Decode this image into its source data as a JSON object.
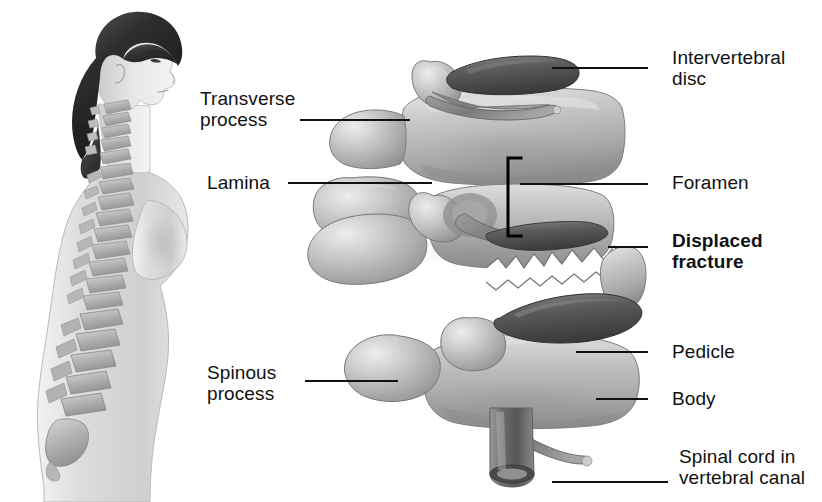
{
  "figure": {
    "background": "#ffffff",
    "ink": "#111111"
  },
  "labels": [
    {
      "id": "intervertebral-disc",
      "text": "Intervertebral\ndisc",
      "bold": false,
      "x": 672,
      "y": 47
    },
    {
      "id": "transverse-process",
      "text": "Transverse\nprocess",
      "bold": false,
      "x": 200,
      "y": 88
    },
    {
      "id": "lamina",
      "text": "Lamina",
      "bold": false,
      "x": 207,
      "y": 172
    },
    {
      "id": "foramen",
      "text": "Foramen",
      "bold": false,
      "x": 672,
      "y": 172
    },
    {
      "id": "displaced-fracture",
      "text": "Displaced\nfracture",
      "bold": true,
      "x": 672,
      "y": 230
    },
    {
      "id": "pedicle",
      "text": "Pedicle",
      "bold": false,
      "x": 672,
      "y": 341
    },
    {
      "id": "body",
      "text": "Body",
      "bold": false,
      "x": 672,
      "y": 388
    },
    {
      "id": "spinous-process",
      "text": "Spinous\nprocess",
      "bold": false,
      "x": 207,
      "y": 362
    },
    {
      "id": "spinal-cord",
      "text": "Spinal cord in\nvertebral canal",
      "bold": false,
      "x": 679,
      "y": 446
    }
  ],
  "leader_lines": [
    {
      "id": "leader-intervertebral-disc",
      "x1": 648,
      "y1": 68,
      "x2": 552,
      "y2": 68
    },
    {
      "id": "leader-transverse-process",
      "x1": 300,
      "y1": 120,
      "x2": 410,
      "y2": 120
    },
    {
      "id": "leader-lamina",
      "x1": 288,
      "y1": 183,
      "x2": 432,
      "y2": 183
    },
    {
      "id": "leader-foramen",
      "x1": 648,
      "y1": 184,
      "x2": 520,
      "y2": 184
    },
    {
      "id": "leader-displaced-fracture",
      "x1": 648,
      "y1": 247,
      "x2": 608,
      "y2": 247
    },
    {
      "id": "leader-pedicle",
      "x1": 648,
      "y1": 352,
      "x2": 576,
      "y2": 352
    },
    {
      "id": "leader-body",
      "x1": 648,
      "y1": 399,
      "x2": 596,
      "y2": 399
    },
    {
      "id": "leader-spinous-process",
      "x1": 305,
      "y1": 381,
      "x2": 398,
      "y2": 381
    },
    {
      "id": "leader-spinal-cord",
      "x1": 668,
      "y1": 482,
      "x2": 552,
      "y2": 482
    }
  ],
  "foramen_bracket": {
    "id": "foramen-bracket",
    "x": 508,
    "y_top": 158,
    "y_bottom": 236,
    "arm": 13
  },
  "anatomy": {
    "left_figure": "female-profile-with-spine",
    "right_figure": "lumbar-vertebrae-lateral-view",
    "fracture": "jagged-displaced-fracture-line"
  }
}
